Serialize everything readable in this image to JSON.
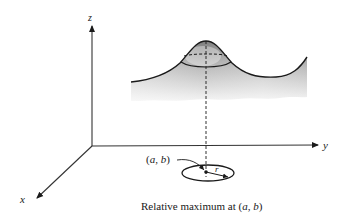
{
  "diagram": {
    "axes": {
      "x_label": "x",
      "y_label": "y",
      "z_label": "z"
    },
    "point_label": "(a, b)",
    "radius_label": "r",
    "caption": "Relative maximum at (a, b)",
    "caption_parts": {
      "prefix": "Relative maximum at (",
      "a": "a",
      "sep": ", ",
      "b": "b",
      "suffix": ")"
    },
    "point_label_parts": {
      "open": "(",
      "a": "a",
      "sep": ", ",
      "b": "b",
      "close": ")"
    },
    "colors": {
      "ink": "#1a1a1a",
      "axis": "#333333",
      "surface_dark": "#8a8a8a",
      "surface_light": "#f2f2f2"
    }
  }
}
